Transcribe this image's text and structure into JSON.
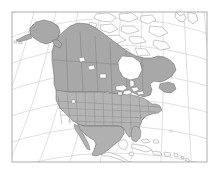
{
  "figure": {
    "kind": "map",
    "title": "",
    "subtitle": "",
    "caption": "",
    "background_color": "#ffffff"
  },
  "frame": {
    "name": "map-frame",
    "x": 12,
    "y": 12,
    "width": 195,
    "height": 150,
    "stroke_color": "#9a9a9a",
    "stroke_width": 0.8,
    "fill_color": "#ffffff"
  },
  "projection": {
    "type": "lambert-conformal-conic",
    "description": "curved graticule, North America centered"
  },
  "graticule": {
    "name": "graticule",
    "stroke_color": "#c9c9c9",
    "stroke_width": 0.6,
    "meridian_count": 9,
    "parallel_count": 7,
    "visible": true
  },
  "ocean": {
    "name": "ocean",
    "fill_color": "#ffffff",
    "label": "Ocean"
  },
  "regions": [
    {
      "name": "region-canada",
      "label": "Canada",
      "shaded": true,
      "fill_color": "#a8a8a8",
      "stroke_color": "#6a6a6a",
      "subdivisions": "provinces"
    },
    {
      "name": "region-united-states",
      "label": "United States",
      "shaded": true,
      "fill_color": "#b4b4b4",
      "stroke_color": "#707070",
      "subdivisions": "states"
    },
    {
      "name": "region-alaska",
      "label": "Alaska",
      "shaded": true,
      "fill_color": "#a8a8a8",
      "stroke_color": "#6a6a6a",
      "subdivisions": "none"
    },
    {
      "name": "region-mexico",
      "label": "Mexico",
      "shaded": true,
      "fill_color": "#b0b0b0",
      "stroke_color": "#6a6a6a",
      "subdivisions": "none"
    },
    {
      "name": "region-greenland",
      "label": "Greenland",
      "shaded": false,
      "fill_color": "#ffffff",
      "stroke_color": "#8a8a8a",
      "subdivisions": "none"
    },
    {
      "name": "region-arctic-islands",
      "label": "Canadian Arctic Archipelago",
      "shaded": false,
      "fill_color": "#ffffff",
      "stroke_color": "#8a8a8a",
      "subdivisions": "none"
    },
    {
      "name": "region-central-america",
      "label": "Central America",
      "shaded": false,
      "fill_color": "#ffffff",
      "stroke_color": "#8a8a8a",
      "subdivisions": "none"
    },
    {
      "name": "region-caribbean",
      "label": "Caribbean Islands",
      "shaded": false,
      "fill_color": "#ffffff",
      "stroke_color": "#8a8a8a",
      "subdivisions": "none"
    }
  ],
  "lakes": {
    "name": "great-lakes",
    "label": "Great Lakes",
    "fill_color": "#ffffff",
    "stroke_color": "#707070"
  },
  "legend": {
    "visible": false,
    "entries": []
  },
  "labels": {
    "visible": false,
    "items": []
  }
}
